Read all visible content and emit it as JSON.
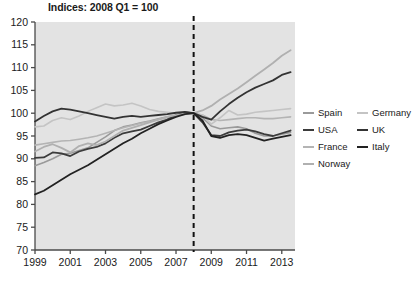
{
  "chart_data": {
    "type": "line",
    "title": "Indices: 2008 Q1 = 100",
    "xlabel": "",
    "ylabel": "",
    "xlim": [
      1999,
      2013.75
    ],
    "ylim": [
      70,
      120
    ],
    "yticks": [
      70,
      75,
      80,
      85,
      90,
      95,
      100,
      105,
      110,
      115,
      120
    ],
    "xticks": [
      1999,
      2001,
      2003,
      2005,
      2007,
      2009,
      2011,
      2013
    ],
    "xtick_labels": [
      "1999",
      "2001",
      "2003",
      "2005",
      "2007",
      "2009",
      "2011",
      "2013"
    ],
    "grid": false,
    "legend_position": "right",
    "annotations": [
      {
        "name": "reference-line-2008q1",
        "type": "vline",
        "x": 2008.0,
        "style": "dashed",
        "color": "#111111"
      }
    ],
    "x": [
      1999.0,
      1999.5,
      2000.0,
      2000.5,
      2001.0,
      2001.5,
      2002.0,
      2002.5,
      2003.0,
      2003.5,
      2004.0,
      2004.5,
      2005.0,
      2005.5,
      2006.0,
      2006.5,
      2007.0,
      2007.5,
      2008.0,
      2008.5,
      2009.0,
      2009.5,
      2010.0,
      2010.5,
      2011.0,
      2011.5,
      2012.0,
      2012.5,
      2013.0,
      2013.5
    ],
    "series": [
      {
        "name": "Spain",
        "color": "#9a9a9a",
        "width": 1.6,
        "values": [
          88.5,
          89.2,
          90.0,
          91.0,
          91.2,
          91.8,
          92.4,
          93.6,
          94.8,
          96.2,
          97.0,
          97.4,
          97.9,
          98.3,
          98.8,
          99.2,
          99.5,
          99.8,
          100.0,
          99.0,
          97.2,
          96.6,
          96.8,
          97.0,
          96.6,
          95.6,
          95.0,
          95.0,
          95.4,
          95.8
        ]
      },
      {
        "name": "USA",
        "color": "#3c3c3c",
        "width": 1.8,
        "values": [
          90.2,
          90.3,
          91.4,
          91.2,
          90.6,
          91.6,
          92.2,
          92.6,
          93.4,
          94.6,
          95.6,
          96.0,
          96.4,
          97.2,
          98.0,
          98.6,
          99.6,
          100.2,
          100.0,
          98.0,
          95.2,
          95.0,
          95.8,
          96.2,
          96.4,
          96.0,
          95.4,
          95.0,
          95.6,
          96.2
        ]
      },
      {
        "name": "France",
        "color": "#b4b4b4",
        "width": 1.6,
        "values": [
          93.0,
          93.3,
          93.6,
          93.9,
          94.0,
          94.3,
          94.6,
          95.0,
          95.6,
          96.2,
          96.8,
          97.3,
          97.8,
          98.2,
          98.6,
          99.0,
          99.4,
          99.7,
          100.0,
          99.6,
          98.6,
          98.4,
          98.6,
          98.8,
          99.0,
          99.0,
          98.8,
          98.8,
          99.0,
          99.2
        ]
      },
      {
        "name": "Norway",
        "color": "#b0b0b0",
        "width": 1.8,
        "values": [
          91.6,
          92.6,
          93.2,
          92.4,
          91.4,
          92.8,
          93.4,
          93.0,
          93.8,
          95.0,
          96.2,
          96.8,
          97.4,
          98.0,
          98.6,
          99.2,
          99.6,
          99.9,
          100.0,
          100.6,
          101.6,
          103.0,
          104.2,
          105.4,
          106.8,
          108.2,
          109.6,
          111.0,
          112.6,
          113.8
        ]
      },
      {
        "name": "Germany",
        "color": "#c4c4c4",
        "width": 1.6,
        "values": [
          97.0,
          97.2,
          98.4,
          99.0,
          98.6,
          99.4,
          100.4,
          101.2,
          102.0,
          101.6,
          101.8,
          102.2,
          101.6,
          100.8,
          100.4,
          100.2,
          100.0,
          100.0,
          100.0,
          99.6,
          97.6,
          99.0,
          100.6,
          99.6,
          99.8,
          100.2,
          100.4,
          100.6,
          100.8,
          101.0
        ]
      },
      {
        "name": "UK",
        "color": "#333333",
        "width": 1.8,
        "values": [
          98.2,
          99.4,
          100.4,
          101.0,
          100.8,
          100.4,
          100.0,
          99.6,
          99.2,
          98.8,
          99.2,
          99.4,
          99.2,
          99.4,
          99.6,
          99.8,
          100.1,
          100.3,
          100.0,
          99.2,
          98.6,
          100.4,
          102.0,
          103.4,
          104.6,
          105.6,
          106.4,
          107.2,
          108.4,
          109.0
        ]
      },
      {
        "name": "Italy",
        "color": "#222222",
        "width": 1.8,
        "values": [
          82.2,
          83.0,
          84.2,
          85.4,
          86.6,
          87.6,
          88.6,
          89.8,
          91.0,
          92.2,
          93.4,
          94.4,
          95.6,
          96.6,
          97.6,
          98.4,
          99.2,
          99.8,
          100.0,
          98.4,
          95.0,
          94.6,
          95.2,
          95.4,
          95.2,
          94.6,
          94.0,
          94.4,
          94.8,
          95.2
        ]
      }
    ]
  },
  "legend": {
    "entries": [
      {
        "label": "Spain",
        "color": "#9a9a9a",
        "col": 0
      },
      {
        "label": "Germany",
        "color": "#c4c4c4",
        "col": 1
      },
      {
        "label": "USA",
        "color": "#3c3c3c",
        "col": 0
      },
      {
        "label": "UK",
        "color": "#333333",
        "col": 1
      },
      {
        "label": "France",
        "color": "#b4b4b4",
        "col": 0
      },
      {
        "label": "Italy",
        "color": "#222222",
        "col": 1
      },
      {
        "label": "Norway",
        "color": "#b0b0b0",
        "col": 0
      }
    ]
  },
  "style": {
    "plot_background": "#e3e3e3",
    "axis_color": "#4a4a4a",
    "text_color": "#1a1a1a"
  }
}
